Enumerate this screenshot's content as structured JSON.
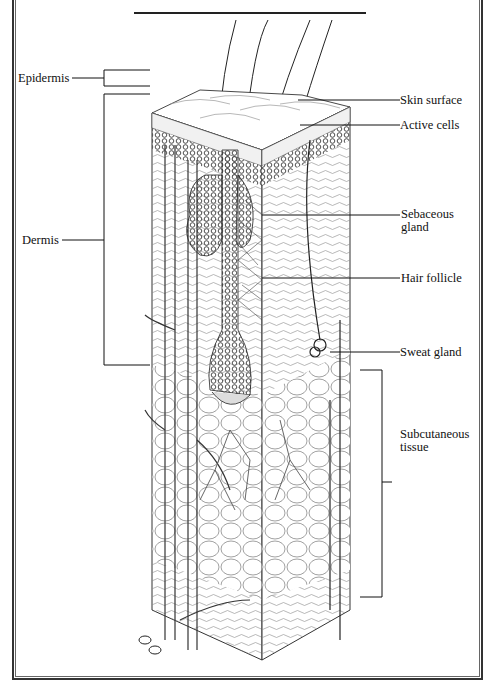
{
  "diagram": {
    "type": "anatomical cross-section",
    "labels": {
      "epidermis": "Epidermis",
      "dermis": "Dermis",
      "skin_surface": "Skin surface",
      "active_cells": "Active cells",
      "sebaceous_gland_1": "Sebaceous",
      "sebaceous_gland_2": "gland",
      "hair_follicle": "Hair follicle",
      "sweat_gland": "Sweat gland",
      "subcutaneous_1": "Subcutaneous",
      "subcutaneous_2": "tissue"
    },
    "colors": {
      "ink": "#222222",
      "background": "#ffffff"
    }
  }
}
